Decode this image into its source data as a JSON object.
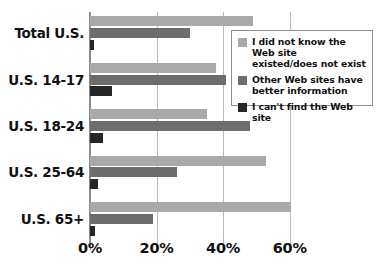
{
  "chart_data": {
    "type": "bar",
    "orientation": "horizontal",
    "title": "",
    "xlabel": "",
    "ylabel": "",
    "xlim": [
      0,
      73
    ],
    "grid": true,
    "legend_position": "top-right",
    "xticks": [
      "0%",
      "20%",
      "40%",
      "60%"
    ],
    "xtick_values": [
      0,
      20,
      40,
      60
    ],
    "categories": [
      "Total U.S.",
      "U.S. 14-17",
      "U.S. 18-24",
      "U.S. 25-64",
      "U.S. 65+"
    ],
    "series": [
      {
        "name": "I did not know the Web site existed/does not exist",
        "color": "#a9a9a9",
        "values": [
          49,
          38,
          35,
          53,
          60.5
        ]
      },
      {
        "name": "Other Web sites have better information",
        "color": "#6d6d6d",
        "values": [
          30,
          41,
          48,
          26,
          19
        ]
      },
      {
        "name": "I can't find the Web site",
        "color": "#262626",
        "values": [
          1.3,
          6.5,
          4,
          2.5,
          1.5
        ]
      }
    ]
  },
  "legend": {
    "items": [
      {
        "label_line1": "I did not know the Web site",
        "label_line2": "existed/does not exist",
        "swatch": "series-0-swatch"
      },
      {
        "label_line1": "Other Web sites have",
        "label_line2": "better information",
        "swatch": "series-1-swatch"
      },
      {
        "label_line1": "I can't find the Web site",
        "label_line2": "",
        "swatch": "series-2-swatch"
      }
    ]
  },
  "colors": {
    "series_light": "#a9a9a9",
    "series_medium": "#6d6d6d",
    "series_dark": "#262626",
    "axis": "#8d8d8d",
    "gridline": "#b9b9b9",
    "text": "#111111",
    "background": "#ffffff"
  }
}
